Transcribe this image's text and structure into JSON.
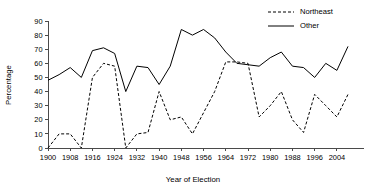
{
  "chart_data": {
    "type": "line",
    "title": "",
    "xlabel": "Year of Election",
    "ylabel": "Percentage",
    "xlim": [
      1900,
      2008
    ],
    "ylim": [
      0,
      90
    ],
    "ytick_step": 10,
    "xtick_step": 8,
    "grid": false,
    "legend_position": "top-right",
    "x": [
      1900,
      1904,
      1908,
      1912,
      1916,
      1920,
      1924,
      1928,
      1932,
      1936,
      1940,
      1944,
      1948,
      1952,
      1956,
      1960,
      1964,
      1968,
      1972,
      1976,
      1980,
      1984,
      1988,
      1992,
      1996,
      2000,
      2004,
      2008
    ],
    "xtick_labels": [
      "1900",
      "1908",
      "1916",
      "1924",
      "1932",
      "1940",
      "1948",
      "1956",
      "1964",
      "1972",
      "1980",
      "1988",
      "1996",
      "2004"
    ],
    "xtick_values": [
      1900,
      1908,
      1916,
      1924,
      1932,
      1940,
      1948,
      1956,
      1964,
      1972,
      1980,
      1988,
      1996,
      2004
    ],
    "ytick_labels": [
      "0",
      "10",
      "20",
      "30",
      "40",
      "50",
      "60",
      "70",
      "80",
      "90"
    ],
    "ytick_values": [
      0,
      10,
      20,
      30,
      40,
      50,
      60,
      70,
      80,
      90
    ],
    "series": [
      {
        "name": "Northeast",
        "style": "dashed",
        "color": "#000000",
        "values": [
          0,
          10,
          10,
          0,
          50,
          60,
          58,
          0,
          10,
          11,
          40,
          20,
          22,
          10,
          25,
          40,
          61,
          61,
          60,
          22,
          30,
          40,
          20,
          11,
          38,
          30,
          22,
          38
        ]
      },
      {
        "name": "Other",
        "style": "solid",
        "color": "#000000",
        "values": [
          48,
          52,
          57,
          50,
          69,
          71,
          67,
          40,
          58,
          57,
          45,
          58,
          84,
          80,
          84,
          78,
          68,
          60,
          59,
          58,
          64,
          68,
          58,
          57,
          50,
          60,
          55,
          72
        ]
      }
    ]
  },
  "legend": {
    "items": [
      {
        "label": "Northeast",
        "style": "dashed"
      },
      {
        "label": "Other",
        "style": "solid"
      }
    ]
  },
  "axes": {
    "y_title": "Percentage",
    "x_title": "Year of Election"
  }
}
